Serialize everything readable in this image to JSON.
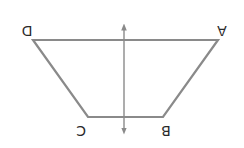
{
  "diagram": {
    "type": "trapezoid-with-symmetry-axis",
    "orientation": "rotated-180",
    "colors": {
      "shape_stroke": "#8a8a8a",
      "axis_stroke": "#8a8a8a",
      "label": "#2a2a2a",
      "background": "#ffffff"
    },
    "vertices": [
      {
        "label": "D",
        "x": 33,
        "y": 40,
        "label_x": 27,
        "label_y": 30
      },
      {
        "label": "A",
        "x": 218,
        "y": 40,
        "label_x": 222,
        "label_y": 30
      },
      {
        "label": "B",
        "x": 163,
        "y": 117,
        "label_x": 166,
        "label_y": 130
      },
      {
        "label": "C",
        "x": 88,
        "y": 117,
        "label_x": 81,
        "label_y": 130
      }
    ],
    "axis": {
      "x": 124,
      "y_top": 25,
      "y_bottom": 133,
      "arrowheads": "both"
    }
  }
}
